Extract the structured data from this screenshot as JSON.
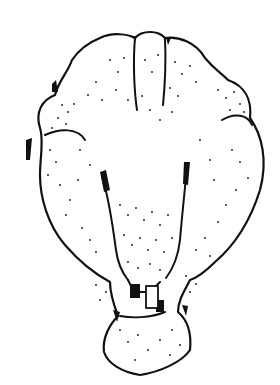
{
  "image": {
    "subject": "stippled-specimen-drawing",
    "style": "black ink outline with stipple dots",
    "colors": {
      "ink": "#111111",
      "background": "#ffffff"
    }
  }
}
